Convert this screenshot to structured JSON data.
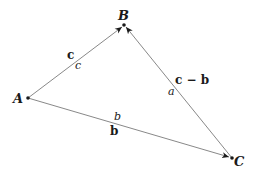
{
  "diagram": {
    "type": "vector-triangle",
    "points": {
      "A": {
        "label": "A",
        "x": 28,
        "y": 98
      },
      "B": {
        "label": "B",
        "x": 124,
        "y": 25
      },
      "C": {
        "label": "C",
        "x": 232,
        "y": 158
      }
    },
    "edges": [
      {
        "from": "A",
        "to": "B",
        "vector_label": "c",
        "length_label": "c"
      },
      {
        "from": "A",
        "to": "C",
        "vector_label": "b",
        "length_label": "b"
      },
      {
        "from": "C",
        "to": "B",
        "vector_label": "c − b",
        "length_label": "a"
      }
    ],
    "colors": {
      "line": "#7a7a7a",
      "text": "#1a1a1a",
      "point": "#1a1a1a"
    }
  }
}
